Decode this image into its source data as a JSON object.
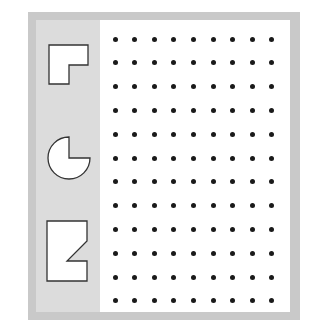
{
  "figure": {
    "colors": {
      "frame": "#c9c9c9",
      "panel": "#dcdcdc",
      "dot_area": "#ffffff",
      "dot": "#1a1a1a",
      "shape_fill": "#ffffff",
      "shape_stroke": "#333333"
    },
    "shapes": [
      {
        "name": "l-shape",
        "label": "L-shaped polygon"
      },
      {
        "name": "pie-shape",
        "label": "Circle with quarter cut out"
      },
      {
        "name": "notched-rectangle",
        "label": "Rectangle with triangular notch"
      }
    ],
    "dot_grid": {
      "columns": 9,
      "rows": 12,
      "origin_x": 115,
      "origin_y": 39,
      "spacing_x": 19.6,
      "spacing_y": 23.8
    }
  }
}
